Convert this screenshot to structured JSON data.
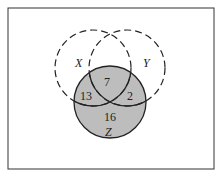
{
  "diagram": {
    "type": "venn",
    "sets": [
      "X",
      "Y",
      "Z"
    ],
    "shaded_set": "Z",
    "regions": {
      "X_and_Z_only": "13",
      "X_and_Y_and_Z": "7",
      "Y_and_Z_only": "2",
      "Z_only": "16"
    },
    "labels": {
      "x": "X",
      "y": "Y",
      "z": "Z"
    },
    "colors": {
      "shade": "#bdbdbd",
      "stroke": "#222222",
      "frame": "#333333"
    }
  }
}
